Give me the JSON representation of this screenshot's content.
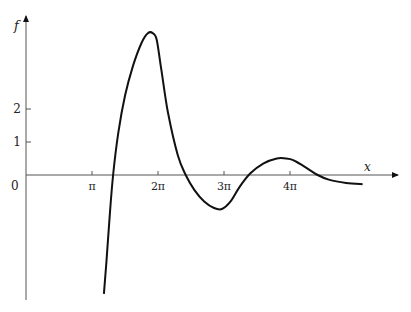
{
  "chart_data": {
    "type": "line",
    "title": "",
    "xlabel": "x",
    "ylabel": "f",
    "x_unit": "pi",
    "xticks": [
      {
        "value": 1,
        "label": "π"
      },
      {
        "value": 2,
        "label": "2π"
      },
      {
        "value": 3,
        "label": "3π"
      },
      {
        "value": 4,
        "label": "4π"
      }
    ],
    "yticks": [
      {
        "value": 1,
        "label": "1"
      },
      {
        "value": 2,
        "label": "2"
      }
    ],
    "origin_label": "0",
    "grid": false,
    "legend": null,
    "xlim_pi": [
      0,
      5.6
    ],
    "ylim": [
      -3.7,
      4.8
    ],
    "series": [
      {
        "name": "f(x)",
        "x_pi": [
          1.18,
          1.22,
          1.27,
          1.32,
          1.4,
          1.5,
          1.62,
          1.75,
          1.85,
          1.92,
          1.98,
          2.05,
          2.15,
          2.3,
          2.42,
          2.55,
          2.7,
          2.85,
          2.97,
          3.1,
          3.24,
          3.4,
          3.6,
          3.8,
          3.93,
          4.05,
          4.2,
          4.42,
          4.6,
          4.85,
          5.1
        ],
        "y": [
          -3.6,
          -2.6,
          -1.2,
          0.0,
          1.3,
          2.4,
          3.3,
          4.0,
          4.3,
          4.3,
          4.1,
          3.2,
          1.9,
          0.6,
          0.0,
          -0.45,
          -0.8,
          -1.0,
          -1.03,
          -0.8,
          -0.35,
          0.05,
          0.35,
          0.5,
          0.5,
          0.45,
          0.28,
          0.0,
          -0.15,
          -0.24,
          -0.28
        ]
      }
    ]
  }
}
